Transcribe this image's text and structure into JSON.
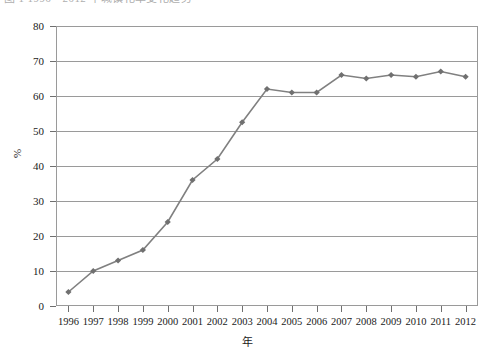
{
  "caption": {
    "text": "图 1  1996—2012 年城镇化率变化趋势"
  },
  "chart_data": {
    "type": "line",
    "title": "",
    "subtitle": "",
    "xlabel": "年",
    "ylabel": "%",
    "categories": [
      "1996",
      "1997",
      "1998",
      "1999",
      "2000",
      "2001",
      "2002",
      "2003",
      "2004",
      "2005",
      "2006",
      "2007",
      "2008",
      "2009",
      "2010",
      "2011",
      "2012"
    ],
    "values": [
      4,
      10,
      13,
      16,
      24,
      36,
      42,
      52.5,
      62,
      61,
      61,
      66,
      65,
      66,
      65.5,
      67,
      65.5
    ],
    "series": [
      {
        "name": "%",
        "values": [
          4,
          10,
          13,
          16,
          24,
          36,
          42,
          52.5,
          62,
          61,
          61,
          66,
          65,
          66,
          65.5,
          67,
          65.5
        ]
      }
    ],
    "ylim": [
      0,
      80
    ],
    "ytick_values": [
      0,
      10,
      20,
      30,
      40,
      50,
      60,
      70,
      80
    ],
    "ytick_labels": [
      "0",
      "10",
      "20",
      "30",
      "40",
      "50",
      "60",
      "70",
      "80"
    ],
    "xtick_labels": [
      "1996",
      "1997",
      "1998",
      "1999",
      "2000",
      "2001",
      "2002",
      "2003",
      "2004",
      "2005",
      "2006",
      "2007",
      "2008",
      "2009",
      "2010",
      "2011",
      "2012"
    ],
    "grid": "horizontal",
    "legend": "none",
    "marker": "diamond",
    "line_color": "#808080",
    "marker_color": "#707070",
    "grid_color": "#9a9a9a",
    "plot_border_color": "#9a9a9a",
    "annotations": []
  }
}
